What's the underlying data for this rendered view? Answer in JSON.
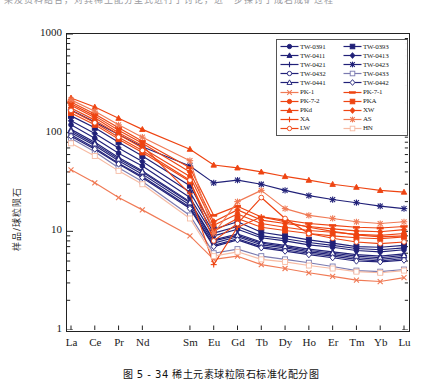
{
  "page": {
    "top_cut_text": "果及资料结合，对其稀土配分型式进行了讨论，进一步探讨了成岩成矿过程",
    "caption": "图 5 - 34  稀土元素球粒陨石标准化配分图"
  },
  "colors": {
    "navy": "#202078",
    "orange": "#EE4412",
    "orange_light": "#F07A55",
    "axis": "#222222"
  },
  "chart_data": {
    "type": "line",
    "title": "稀土元素球粒陨石标准化配分图",
    "xlabel": "",
    "ylabel": "样品/球粒陨石",
    "yscale": "log",
    "ylim": [
      1,
      1000
    ],
    "yticks": [
      1,
      10,
      100,
      1000
    ],
    "ytick_labels": [
      "1",
      "10",
      "100",
      "1000"
    ],
    "grid": false,
    "legend_position": "top-right",
    "categories": [
      "La",
      "Ce",
      "Pr",
      "Nd",
      "Sm",
      "Eu",
      "Gd",
      "Tb",
      "Dy",
      "Ho",
      "Er",
      "Tm",
      "Yb",
      "Lu"
    ],
    "x_positions": [
      0,
      1,
      2,
      3,
      5,
      6,
      7,
      8,
      9,
      10,
      11,
      12,
      13,
      14
    ],
    "series": [
      {
        "name": "TW-0391",
        "color": "#202078",
        "marker": "circle",
        "filled": true,
        "values": [
          120,
          88,
          62,
          46,
          22,
          9.0,
          10.5,
          8.6,
          8.0,
          7.3,
          6.9,
          6.4,
          6.2,
          6.5
        ]
      },
      {
        "name": "TW-0393",
        "color": "#202078",
        "marker": "square",
        "filled": true,
        "values": [
          148,
          112,
          80,
          58,
          29,
          10.5,
          12.5,
          9.8,
          9.0,
          8.2,
          7.6,
          7.0,
          6.9,
          7.2
        ]
      },
      {
        "name": "TW-0411",
        "color": "#202078",
        "marker": "triangle",
        "filled": true,
        "values": [
          108,
          80,
          56,
          41,
          20,
          8.2,
          9.4,
          7.8,
          7.2,
          6.6,
          6.2,
          5.8,
          5.6,
          5.9
        ]
      },
      {
        "name": "TW-0413",
        "color": "#202078",
        "marker": "diamond",
        "filled": true,
        "values": [
          132,
          98,
          70,
          51,
          25,
          9.6,
          11.2,
          9.0,
          8.4,
          7.7,
          7.2,
          6.7,
          6.5,
          6.8
        ]
      },
      {
        "name": "TW-0421",
        "color": "#202078",
        "marker": "plus",
        "filled": false,
        "values": [
          100,
          74,
          52,
          38,
          18.5,
          7.6,
          8.8,
          7.3,
          6.8,
          6.2,
          5.8,
          5.4,
          5.2,
          5.5
        ]
      },
      {
        "name": "TW-0423",
        "color": "#202078",
        "marker": "asterisk",
        "filled": false,
        "values": [
          170,
          128,
          96,
          72,
          46,
          31,
          33,
          30,
          26,
          23,
          21,
          19.5,
          18.0,
          17.0
        ]
      },
      {
        "name": "TW-0432",
        "color": "#202078",
        "marker": "circle",
        "filled": false,
        "values": [
          95,
          70,
          49,
          36,
          17.5,
          7.2,
          8.4,
          7.0,
          6.5,
          6.0,
          5.6,
          5.2,
          5.0,
          5.3
        ]
      },
      {
        "name": "TW-0433",
        "color": "#7a7ab0",
        "marker": "square",
        "filled": false,
        "values": [
          88,
          64,
          44,
          32,
          14.5,
          6.0,
          6.6,
          5.6,
          5.2,
          4.8,
          4.4,
          4.0,
          3.9,
          4.1
        ]
      },
      {
        "name": "TW-0441",
        "color": "#202078",
        "marker": "triangle",
        "filled": false,
        "values": [
          104,
          77,
          54,
          40,
          19.5,
          8.0,
          9.1,
          7.6,
          7.0,
          6.4,
          6.0,
          5.6,
          5.4,
          5.7
        ]
      },
      {
        "name": "TW-0442",
        "color": "#202078",
        "marker": "diamond",
        "filled": false,
        "values": [
          92,
          68,
          48,
          35,
          17.0,
          7.0,
          8.2,
          6.8,
          6.3,
          5.8,
          5.4,
          5.0,
          4.9,
          5.1
        ]
      },
      {
        "name": "PK-1",
        "color": "#F07A55",
        "marker": "cross",
        "filled": false,
        "values": [
          42,
          31,
          22,
          16.5,
          9.0,
          5.2,
          5.6,
          4.6,
          4.2,
          3.8,
          3.5,
          3.2,
          3.1,
          3.4
        ]
      },
      {
        "name": "PK-7-1",
        "color": "#EE4412",
        "marker": "dash",
        "filled": true,
        "values": [
          205,
          155,
          112,
          82,
          44,
          14.5,
          18.0,
          14.0,
          13.0,
          12.0,
          11.5,
          11.0,
          10.8,
          11.2
        ]
      },
      {
        "name": "PK-7-2",
        "color": "#EE4412",
        "marker": "circle",
        "filled": true,
        "values": [
          178,
          134,
          96,
          70,
          36,
          11.5,
          15.0,
          12.0,
          11.0,
          10.2,
          9.8,
          9.3,
          9.1,
          9.5
        ]
      },
      {
        "name": "PKA",
        "color": "#EE4412",
        "marker": "square",
        "filled": true,
        "values": [
          158,
          120,
          86,
          63,
          32,
          10.0,
          13.5,
          11.0,
          10.2,
          9.5,
          9.0,
          8.6,
          8.4,
          8.8
        ]
      },
      {
        "name": "PKd",
        "color": "#EE4412",
        "marker": "triangle",
        "filled": true,
        "values": [
          225,
          182,
          140,
          108,
          68,
          47,
          44,
          40,
          36,
          33,
          30,
          28,
          26,
          25
        ]
      },
      {
        "name": "XW",
        "color": "#EE4412",
        "marker": "diamond",
        "filled": true,
        "values": [
          196,
          148,
          106,
          78,
          40,
          12.5,
          16.5,
          13.0,
          12.0,
          11.2,
          10.6,
          10.1,
          9.9,
          10.4
        ]
      },
      {
        "name": "XA",
        "color": "#EE4412",
        "marker": "plus",
        "filled": false,
        "values": [
          190,
          142,
          100,
          74,
          24,
          4.6,
          11.0,
          14.0,
          12.5,
          11.0,
          10.0,
          9.2,
          8.8,
          9.0
        ]
      },
      {
        "name": "AS",
        "color": "#F07A55",
        "marker": "asterisk",
        "filled": false,
        "values": [
          215,
          165,
          120,
          90,
          52,
          9.5,
          20,
          26,
          17,
          14.5,
          13.5,
          12.5,
          12.0,
          12.5
        ]
      },
      {
        "name": "LW",
        "color": "#EE4412",
        "marker": "circle",
        "filled": false,
        "values": [
          168,
          126,
          90,
          66,
          33,
          8.0,
          12.0,
          22,
          13.5,
          9.5,
          8.5,
          7.8,
          7.5,
          7.8
        ]
      },
      {
        "name": "HN",
        "color": "#F7BBA3",
        "marker": "square",
        "filled": false,
        "values": [
          78,
          58,
          41,
          30,
          13.5,
          5.6,
          6.2,
          5.2,
          4.9,
          4.5,
          4.2,
          3.9,
          3.8,
          4.0
        ]
      }
    ]
  },
  "legend": {
    "items": [
      {
        "label": "TW-0391"
      },
      {
        "label": "TW-0393"
      },
      {
        "label": "TW-0411"
      },
      {
        "label": "TW-0413"
      },
      {
        "label": "TW-0421"
      },
      {
        "label": "TW-0423"
      },
      {
        "label": "TW-0432"
      },
      {
        "label": "TW-0433"
      },
      {
        "label": "TW-0441"
      },
      {
        "label": "TW-0442"
      },
      {
        "label": "PK-1"
      },
      {
        "label": "PK-7-1"
      },
      {
        "label": "PK-7-2"
      },
      {
        "label": "PKA"
      },
      {
        "label": "PKd"
      },
      {
        "label": "XW"
      },
      {
        "label": "XA"
      },
      {
        "label": "AS"
      },
      {
        "label": "LW"
      },
      {
        "label": "HN"
      }
    ]
  }
}
